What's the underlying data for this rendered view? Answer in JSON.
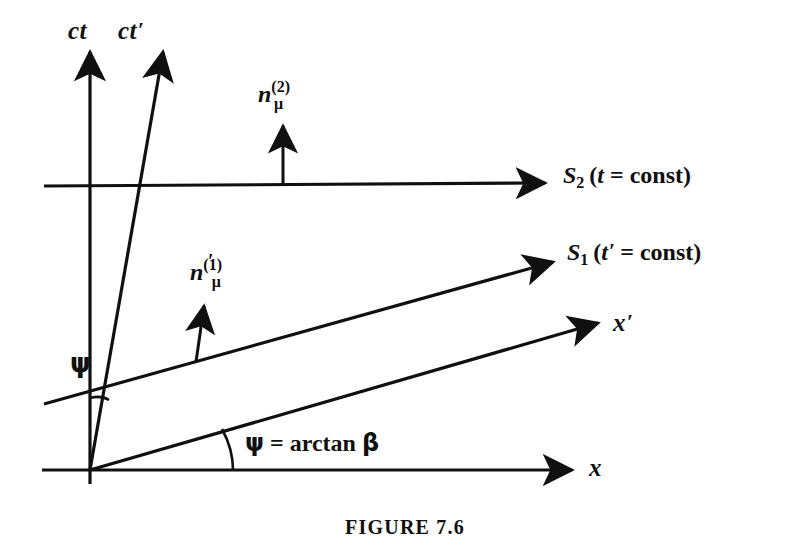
{
  "figure": {
    "caption": "FIGURE 7.6",
    "background_color": "#ffffff",
    "ink_color": "#101010"
  },
  "axes": [
    {
      "id": "ct",
      "label": "ct",
      "prime": "",
      "description": "vertical time axis of frame S"
    },
    {
      "id": "ct-prime",
      "label": "ct",
      "prime": "′",
      "description": "slanted time axis of boosted frame S prime"
    },
    {
      "id": "x",
      "label": "x",
      "prime": "",
      "description": "horizontal space axis of frame S"
    },
    {
      "id": "x-prime",
      "label": "x",
      "prime": "′",
      "description": "slanted space axis of boosted frame S prime"
    }
  ],
  "surfaces": [
    {
      "id": "s2",
      "symbol": "S",
      "subscript": "2",
      "open_paren": "(",
      "variable": "t",
      "prime": "",
      "equals": "=",
      "value": "const",
      "close_paren": ")"
    },
    {
      "id": "s1",
      "symbol": "S",
      "subscript": "1",
      "open_paren": "(",
      "variable": "t",
      "prime": "′",
      "equals": "=",
      "value": "const",
      "close_paren": ")"
    }
  ],
  "normals": [
    {
      "id": "n2",
      "base": "n",
      "superscript": "(2)",
      "subscript": "μ",
      "prime": ""
    },
    {
      "id": "n1",
      "base": "n",
      "superscript": "(1)",
      "subscript": "μ",
      "prime": "′"
    }
  ],
  "annotations": {
    "psi_symbol": "ψ",
    "angle_equation": {
      "psi": "ψ",
      "equals": "=",
      "arctan": "arctan",
      "beta": "β"
    }
  }
}
